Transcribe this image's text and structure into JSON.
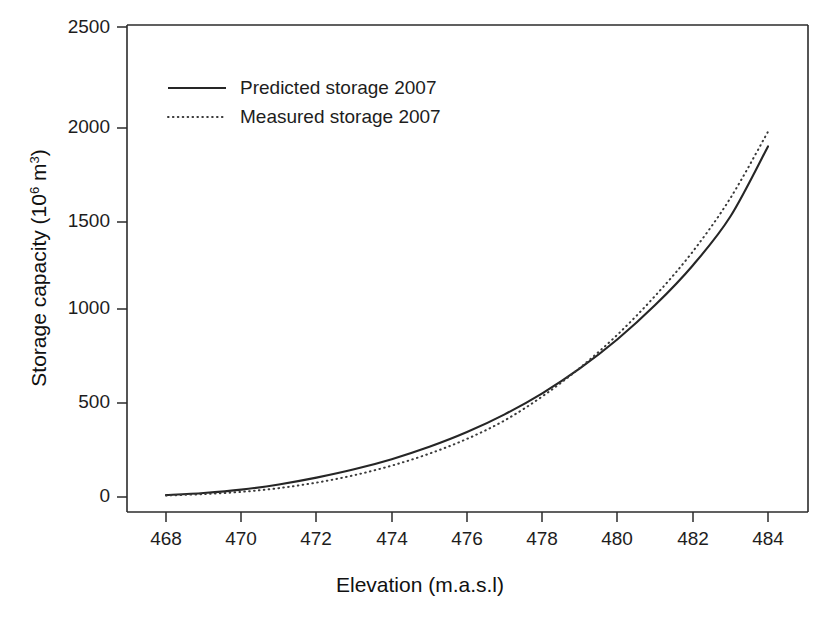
{
  "chart_data": {
    "type": "line",
    "title": "",
    "xlabel": "Elevation (m.a.s.l)",
    "ylabel_main": "Storage capacity (10",
    "ylabel_sup1": "6",
    "ylabel_mid": " m",
    "ylabel_sup2": "3",
    "ylabel_end": ")",
    "ylabel_full": "Storage capacity (10^6 m^3)",
    "xlim": [
      467,
      485
    ],
    "ylim": [
      0,
      2500
    ],
    "xticks": [
      468,
      470,
      472,
      474,
      476,
      478,
      480,
      482,
      484
    ],
    "yticks": [
      0,
      500,
      1000,
      1500,
      2000,
      2500
    ],
    "grid": false,
    "legend_position": "upper-left-inside",
    "x": [
      468,
      469,
      470,
      471,
      472,
      473,
      474,
      475,
      476,
      477,
      478,
      479,
      480,
      481,
      482,
      483,
      484
    ],
    "series": [
      {
        "name": "Predicted storage 2007",
        "style": "solid",
        "color": "#262626",
        "values": [
          10,
          22,
          40,
          68,
          105,
          150,
          205,
          272,
          352,
          448,
          562,
          697,
          855,
          1040,
          1255,
          1520,
          1900
        ]
      },
      {
        "name": "Measured storage 2007",
        "style": "dotted",
        "color": "#3a3a3a",
        "values": [
          8,
          16,
          28,
          48,
          78,
          118,
          170,
          235,
          315,
          415,
          545,
          700,
          880,
          1090,
          1330,
          1620,
          1980
        ]
      }
    ],
    "annotations": []
  },
  "legend": {
    "items": [
      {
        "label": "Predicted storage 2007",
        "style": "solid"
      },
      {
        "label": "Measured storage 2007",
        "style": "dotted"
      }
    ]
  },
  "axes": {
    "x_title": "Elevation (m.a.s.l)",
    "y_title_parts": {
      "lead": "Storage capacity (10",
      "sup1": "6",
      "mid": " m",
      "sup2": "3",
      "tail": ")"
    }
  }
}
